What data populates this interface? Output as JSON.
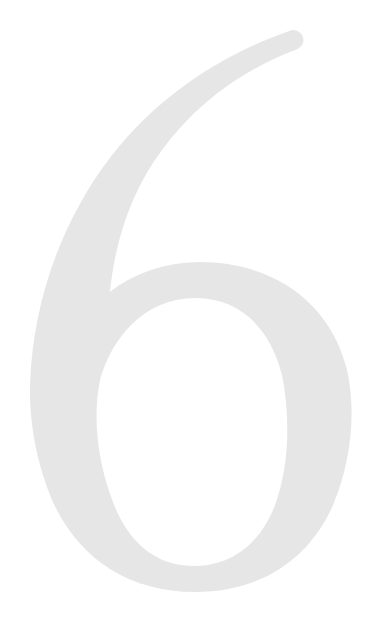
{
  "page": {
    "numeral": "6",
    "numeral_color": "#e6e6e6",
    "background_color": "#ffffff"
  }
}
